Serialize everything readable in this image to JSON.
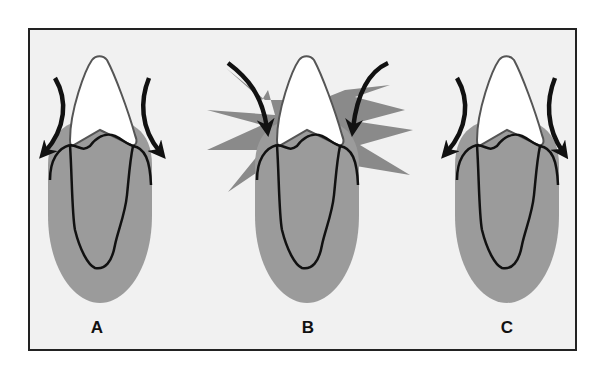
{
  "figure": {
    "background": "#f1f1f1",
    "frame_color": "#222222",
    "gum_color": "#9a9a9a",
    "inflammation_color": "#8c8c8c",
    "crown_fill": "#ffffff",
    "outline_color": "#111111"
  },
  "panels": [
    {
      "id": "A",
      "label": "A",
      "description": "Tooth with arrows pointing downward away from the gingiva (normal food deflection)"
    },
    {
      "id": "B",
      "label": "B",
      "description": "Tooth with arrows impacting gingiva, starburst indicating trauma/inflammation"
    },
    {
      "id": "C",
      "label": "C",
      "description": "Tooth with arrows pointing downward away from the gingiva"
    }
  ]
}
